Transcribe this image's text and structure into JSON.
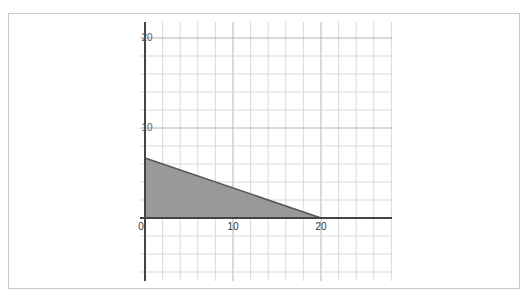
{
  "chart_data": {
    "type": "area",
    "title": "",
    "xlabel": "",
    "ylabel": "",
    "xlim": [
      0,
      28
    ],
    "ylim": [
      -7,
      20
    ],
    "grid": true,
    "grid_step": 2,
    "x_ticks": [
      0,
      10,
      20
    ],
    "x_tick_labels": [
      "0",
      "10",
      "20"
    ],
    "y_ticks": [
      10,
      20
    ],
    "y_tick_labels": [
      "10",
      "20"
    ],
    "series": [
      {
        "name": "feasible region",
        "boundary_equation": "x + 3y = 20",
        "vertices": [
          [
            0,
            0
          ],
          [
            0,
            6.67
          ],
          [
            20,
            0
          ]
        ],
        "fill_color": "#999999",
        "line_color": "#555555"
      }
    ]
  },
  "labels": {
    "x0": "0",
    "x10": "10",
    "x20": "20",
    "y10": "10",
    "y20": "20"
  },
  "colors": {
    "grid": "#d9d9d9",
    "axis": "#444444",
    "fill": "#999999",
    "frame": "#c8c8c8"
  }
}
